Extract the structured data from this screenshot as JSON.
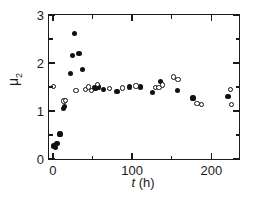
{
  "chart_data": {
    "type": "scatter",
    "title": "",
    "xlabel": "t (h)",
    "xlabel_italic_part": "t",
    "xlabel_rest": " (h)",
    "ylabel": "μ₂",
    "ylabel_base": "μ",
    "ylabel_sub": "2",
    "xlim": [
      -5,
      235
    ],
    "ylim": [
      0,
      3
    ],
    "xticks": [
      0,
      100,
      200
    ],
    "xtick_labels": [
      "0",
      "100",
      "200"
    ],
    "xticks_minor": [
      50,
      150
    ],
    "yticks": [
      0,
      1,
      2,
      3
    ],
    "ytick_labels": [
      "0",
      "1",
      "2",
      "3"
    ],
    "yticks_minor": [
      0.5,
      1.5,
      2.5
    ],
    "grid": false,
    "legend": null,
    "series": [
      {
        "name": "filled-circles",
        "marker": "filled circle",
        "color": "#111111",
        "points": [
          [
            1,
            0.27
          ],
          [
            3,
            0.24
          ],
          [
            5,
            0.33
          ],
          [
            9,
            0.52
          ],
          [
            13,
            1.06
          ],
          [
            15,
            1.1
          ],
          [
            22,
            1.78
          ],
          [
            25,
            2.15
          ],
          [
            27,
            2.62
          ],
          [
            33,
            2.2
          ],
          [
            37,
            1.87
          ],
          [
            53,
            1.48
          ],
          [
            57,
            1.5
          ],
          [
            64,
            1.45
          ],
          [
            81,
            1.41
          ],
          [
            97,
            1.5
          ],
          [
            111,
            1.5
          ],
          [
            126,
            1.38
          ],
          [
            136,
            1.62
          ],
          [
            157,
            1.43
          ],
          [
            177,
            1.27
          ],
          [
            221,
            1.3
          ]
        ]
      },
      {
        "name": "open-circles",
        "marker": "open circle",
        "color": "#111111",
        "points": [
          [
            1,
            1.51
          ],
          [
            14,
            1.21
          ],
          [
            16,
            1.22
          ],
          [
            29,
            1.43
          ],
          [
            41,
            1.45
          ],
          [
            45,
            1.5
          ],
          [
            49,
            1.42
          ],
          [
            56,
            1.55
          ],
          [
            71,
            1.47
          ],
          [
            88,
            1.48
          ],
          [
            105,
            1.52
          ],
          [
            130,
            1.49
          ],
          [
            134,
            1.49
          ],
          [
            138,
            1.54
          ],
          [
            152,
            1.71
          ],
          [
            158,
            1.65
          ],
          [
            182,
            1.15
          ],
          [
            188,
            1.14
          ],
          [
            224,
            1.45
          ],
          [
            226,
            1.14
          ]
        ]
      }
    ]
  },
  "axes": {
    "x_axis_name": "time-axis",
    "y_axis_name": "mu2-axis"
  }
}
